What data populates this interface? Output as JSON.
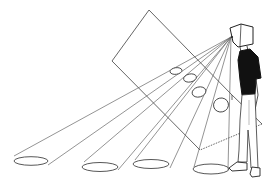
{
  "illustration": {
    "title": "Line drawing: box-headed figure viewing through a picture plane with sight cones projecting to ellipses",
    "colors": {
      "background": "#ffffff",
      "line": "#555555",
      "ink": "#111111"
    },
    "elements": {
      "figure": "standing person with box head, black t-shirt, light trousers, sneakers",
      "picture_plane": "tilted rectangular plane between eye and ground",
      "sight_cones": 4,
      "plane_ellipses": 4,
      "ground_ellipses": 4
    }
  }
}
